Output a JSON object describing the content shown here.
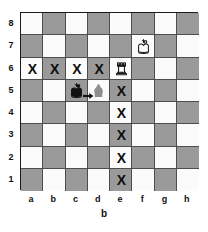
{
  "diagram": {
    "type": "chessboard",
    "caption": "b",
    "credit": "",
    "files": [
      "a",
      "b",
      "c",
      "d",
      "e",
      "f",
      "g",
      "h"
    ],
    "ranks": [
      "8",
      "7",
      "6",
      "5",
      "4",
      "3",
      "2",
      "1"
    ],
    "colors": {
      "light_square": "#fbfbfb",
      "dark_square": "#9a9a9a",
      "border": "#1a1a1a",
      "grid_line": "#4d4d4d",
      "marker": "#0d0d0d",
      "ghost": "#8f8f8f",
      "piece_black": "#121212",
      "piece_white_fill": "#fdfdfd",
      "piece_white_outline": "#1b1b1b"
    },
    "squares": [
      {
        "id": "a8",
        "file": 0,
        "rank": 0,
        "shade": "light"
      },
      {
        "id": "b8",
        "file": 1,
        "rank": 0,
        "shade": "dark"
      },
      {
        "id": "c8",
        "file": 2,
        "rank": 0,
        "shade": "light"
      },
      {
        "id": "d8",
        "file": 3,
        "rank": 0,
        "shade": "dark"
      },
      {
        "id": "e8",
        "file": 4,
        "rank": 0,
        "shade": "light"
      },
      {
        "id": "f8",
        "file": 5,
        "rank": 0,
        "shade": "dark"
      },
      {
        "id": "g8",
        "file": 6,
        "rank": 0,
        "shade": "light"
      },
      {
        "id": "h8",
        "file": 7,
        "rank": 0,
        "shade": "dark"
      },
      {
        "id": "a7",
        "file": 0,
        "rank": 1,
        "shade": "dark"
      },
      {
        "id": "b7",
        "file": 1,
        "rank": 1,
        "shade": "light"
      },
      {
        "id": "c7",
        "file": 2,
        "rank": 1,
        "shade": "dark"
      },
      {
        "id": "d7",
        "file": 3,
        "rank": 1,
        "shade": "light"
      },
      {
        "id": "e7",
        "file": 4,
        "rank": 1,
        "shade": "dark"
      },
      {
        "id": "f7",
        "file": 5,
        "rank": 1,
        "shade": "light"
      },
      {
        "id": "g7",
        "file": 6,
        "rank": 1,
        "shade": "dark"
      },
      {
        "id": "h7",
        "file": 7,
        "rank": 1,
        "shade": "light"
      },
      {
        "id": "a6",
        "file": 0,
        "rank": 2,
        "shade": "light"
      },
      {
        "id": "b6",
        "file": 1,
        "rank": 2,
        "shade": "dark"
      },
      {
        "id": "c6",
        "file": 2,
        "rank": 2,
        "shade": "light"
      },
      {
        "id": "d6",
        "file": 3,
        "rank": 2,
        "shade": "dark"
      },
      {
        "id": "e6",
        "file": 4,
        "rank": 2,
        "shade": "light"
      },
      {
        "id": "f6",
        "file": 5,
        "rank": 2,
        "shade": "dark"
      },
      {
        "id": "g6",
        "file": 6,
        "rank": 2,
        "shade": "light"
      },
      {
        "id": "h6",
        "file": 7,
        "rank": 2,
        "shade": "dark"
      },
      {
        "id": "a5",
        "file": 0,
        "rank": 3,
        "shade": "dark"
      },
      {
        "id": "b5",
        "file": 1,
        "rank": 3,
        "shade": "light"
      },
      {
        "id": "c5",
        "file": 2,
        "rank": 3,
        "shade": "dark"
      },
      {
        "id": "d5",
        "file": 3,
        "rank": 3,
        "shade": "light"
      },
      {
        "id": "e5",
        "file": 4,
        "rank": 3,
        "shade": "dark"
      },
      {
        "id": "f5",
        "file": 5,
        "rank": 3,
        "shade": "light"
      },
      {
        "id": "g5",
        "file": 6,
        "rank": 3,
        "shade": "dark"
      },
      {
        "id": "h5",
        "file": 7,
        "rank": 3,
        "shade": "light"
      },
      {
        "id": "a4",
        "file": 0,
        "rank": 4,
        "shade": "light"
      },
      {
        "id": "b4",
        "file": 1,
        "rank": 4,
        "shade": "dark"
      },
      {
        "id": "c4",
        "file": 2,
        "rank": 4,
        "shade": "light"
      },
      {
        "id": "d4",
        "file": 3,
        "rank": 4,
        "shade": "dark"
      },
      {
        "id": "e4",
        "file": 4,
        "rank": 4,
        "shade": "light"
      },
      {
        "id": "f4",
        "file": 5,
        "rank": 4,
        "shade": "dark"
      },
      {
        "id": "g4",
        "file": 6,
        "rank": 4,
        "shade": "light"
      },
      {
        "id": "h4",
        "file": 7,
        "rank": 4,
        "shade": "dark"
      },
      {
        "id": "a3",
        "file": 0,
        "rank": 5,
        "shade": "dark"
      },
      {
        "id": "b3",
        "file": 1,
        "rank": 5,
        "shade": "light"
      },
      {
        "id": "c3",
        "file": 2,
        "rank": 5,
        "shade": "dark"
      },
      {
        "id": "d3",
        "file": 3,
        "rank": 5,
        "shade": "light"
      },
      {
        "id": "e3",
        "file": 4,
        "rank": 5,
        "shade": "dark"
      },
      {
        "id": "f3",
        "file": 5,
        "rank": 5,
        "shade": "light"
      },
      {
        "id": "g3",
        "file": 6,
        "rank": 5,
        "shade": "dark"
      },
      {
        "id": "h3",
        "file": 7,
        "rank": 5,
        "shade": "light"
      },
      {
        "id": "a2",
        "file": 0,
        "rank": 6,
        "shade": "light"
      },
      {
        "id": "b2",
        "file": 1,
        "rank": 6,
        "shade": "dark"
      },
      {
        "id": "c2",
        "file": 2,
        "rank": 6,
        "shade": "light"
      },
      {
        "id": "d2",
        "file": 3,
        "rank": 6,
        "shade": "dark"
      },
      {
        "id": "e2",
        "file": 4,
        "rank": 6,
        "shade": "light"
      },
      {
        "id": "f2",
        "file": 5,
        "rank": 6,
        "shade": "dark"
      },
      {
        "id": "g2",
        "file": 6,
        "rank": 6,
        "shade": "light"
      },
      {
        "id": "h2",
        "file": 7,
        "rank": 6,
        "shade": "dark"
      },
      {
        "id": "a1",
        "file": 0,
        "rank": 7,
        "shade": "dark"
      },
      {
        "id": "b1",
        "file": 1,
        "rank": 7,
        "shade": "light"
      },
      {
        "id": "c1",
        "file": 2,
        "rank": 7,
        "shade": "dark"
      },
      {
        "id": "d1",
        "file": 3,
        "rank": 7,
        "shade": "light"
      },
      {
        "id": "e1",
        "file": 4,
        "rank": 7,
        "shade": "dark"
      },
      {
        "id": "f1",
        "file": 5,
        "rank": 7,
        "shade": "light"
      },
      {
        "id": "g1",
        "file": 6,
        "rank": 7,
        "shade": "dark"
      },
      {
        "id": "h1",
        "file": 7,
        "rank": 7,
        "shade": "light"
      }
    ],
    "pieces": [
      {
        "id": "white-king-f7",
        "square": "f7",
        "file": 5,
        "rank": 1,
        "piece": "king",
        "color": "white",
        "glyph": "♔"
      },
      {
        "id": "white-rook-e6",
        "square": "e6",
        "file": 4,
        "rank": 2,
        "piece": "rook",
        "color": "white",
        "glyph": "♖"
      },
      {
        "id": "black-king-c5",
        "square": "c5",
        "file": 2,
        "rank": 3,
        "piece": "king",
        "color": "black",
        "glyph": "♚"
      }
    ],
    "ghost_pieces": [
      {
        "id": "ghost-king-d5",
        "square": "d5",
        "file": 3,
        "rank": 3,
        "piece": "king",
        "label": "destination"
      }
    ],
    "arrows": [
      {
        "id": "move-arrow-c5-d5",
        "from": "c5",
        "to": "d5",
        "direction": "right"
      }
    ],
    "markers": [
      {
        "id": "x-a6",
        "square": "a6",
        "file": 0,
        "rank": 2,
        "symbol": "X"
      },
      {
        "id": "x-b6",
        "square": "b6",
        "file": 1,
        "rank": 2,
        "symbol": "X"
      },
      {
        "id": "x-c6",
        "square": "c6",
        "file": 2,
        "rank": 2,
        "symbol": "X"
      },
      {
        "id": "x-d6",
        "square": "d6",
        "file": 3,
        "rank": 2,
        "symbol": "X"
      },
      {
        "id": "x-e5",
        "square": "e5",
        "file": 4,
        "rank": 3,
        "symbol": "X"
      },
      {
        "id": "x-e4",
        "square": "e4",
        "file": 4,
        "rank": 4,
        "symbol": "X"
      },
      {
        "id": "x-e3",
        "square": "e3",
        "file": 4,
        "rank": 5,
        "symbol": "X"
      },
      {
        "id": "x-e2",
        "square": "e2",
        "file": 4,
        "rank": 6,
        "symbol": "X"
      },
      {
        "id": "x-e1",
        "square": "e1",
        "file": 4,
        "rank": 7,
        "symbol": "X"
      }
    ]
  }
}
